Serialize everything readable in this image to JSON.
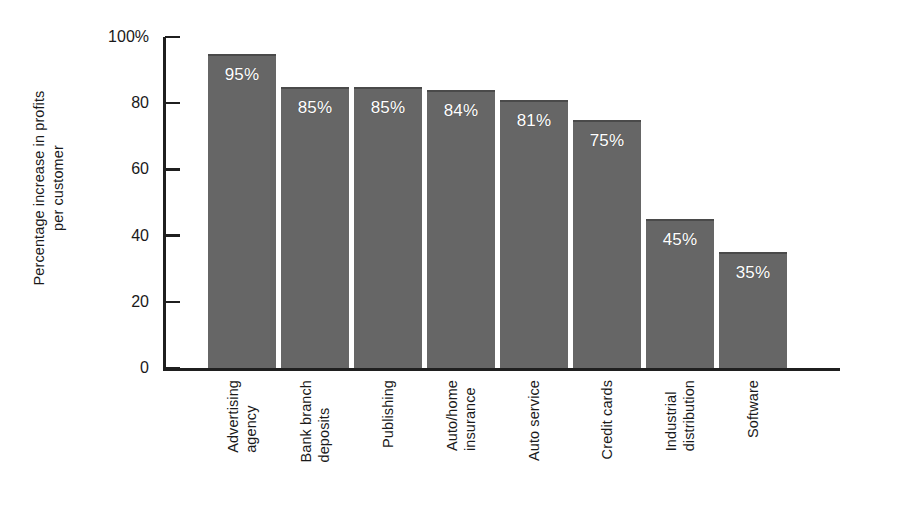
{
  "chart_data": {
    "type": "bar",
    "title": "",
    "subtitle": "",
    "xlabel": "",
    "ylabel": "Percentage increase in profits per customer",
    "ylabel_lines": [
      "Percentage increase in profits",
      "per customer"
    ],
    "categories": [
      "Advertising agency",
      "Bank branch deposits",
      "Publishing",
      "Auto/home insurance",
      "Auto service",
      "Credit cards",
      "Industrial distribution",
      "Software"
    ],
    "category_lines": [
      [
        "Advertising",
        "agency"
      ],
      [
        "Bank branch",
        "deposits"
      ],
      [
        "Publishing"
      ],
      [
        "Auto/home",
        "insurance"
      ],
      [
        "Auto service"
      ],
      [
        "Credit cards"
      ],
      [
        "Industrial",
        "distribution"
      ],
      [
        "Software"
      ]
    ],
    "values": [
      95,
      85,
      85,
      84,
      81,
      75,
      45,
      35
    ],
    "bar_value_labels": [
      "95%",
      "85%",
      "85%",
      "84%",
      "81%",
      "75%",
      "45%",
      "35%"
    ],
    "ylim": [
      0,
      100
    ],
    "yticks": [
      0,
      20,
      40,
      60,
      80,
      100
    ],
    "ytick_labels": [
      "0",
      "20",
      "40",
      "60",
      "80",
      "100%"
    ],
    "grid": false,
    "legend": null,
    "legend_position": "none",
    "bar_color": "#666666",
    "bar_edge_color": "#4a4a4a",
    "bar_label_color": "#ffffff",
    "axis_color": "#1f1f1f",
    "background_color": "#ffffff",
    "tick_direction": "in",
    "units": "percent"
  }
}
